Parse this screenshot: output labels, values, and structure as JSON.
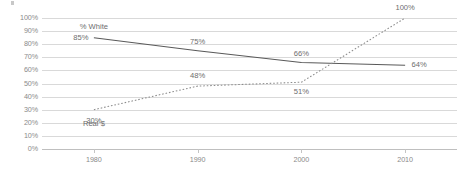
{
  "chart_data": {
    "type": "line",
    "title": "",
    "xlabel": "",
    "ylabel": "",
    "xlim": [
      1975,
      2015
    ],
    "ylim": [
      0,
      100
    ],
    "grid": true,
    "legend_position": "inline-annotation",
    "x": [
      1980,
      1990,
      2000,
      2010
    ],
    "x_tick_labels": [
      "1980",
      "1990",
      "2000",
      "2010"
    ],
    "y_tick_labels": [
      "0%",
      "10%",
      "20%",
      "30%",
      "40%",
      "50%",
      "60%",
      "70%",
      "80%",
      "90%",
      "100%"
    ],
    "y_tick_values": [
      0,
      10,
      20,
      30,
      40,
      50,
      60,
      70,
      80,
      90,
      100
    ],
    "series": [
      {
        "name": "% White",
        "style": "solid",
        "color": "#595959",
        "values": [
          85,
          75,
          66,
          64
        ],
        "point_labels": [
          "85%",
          "75%",
          "66%",
          "64%"
        ]
      },
      {
        "name": "Real $",
        "style": "dotted",
        "color": "#8c8c8c",
        "values": [
          30,
          48,
          51,
          100
        ],
        "point_labels": [
          "30%",
          "48%",
          "51%",
          "100%"
        ]
      }
    ],
    "annotations": [
      {
        "text": "% White",
        "x": 1980,
        "y": 93
      },
      {
        "text": "Real $",
        "x": 1980,
        "y": 19
      }
    ]
  }
}
